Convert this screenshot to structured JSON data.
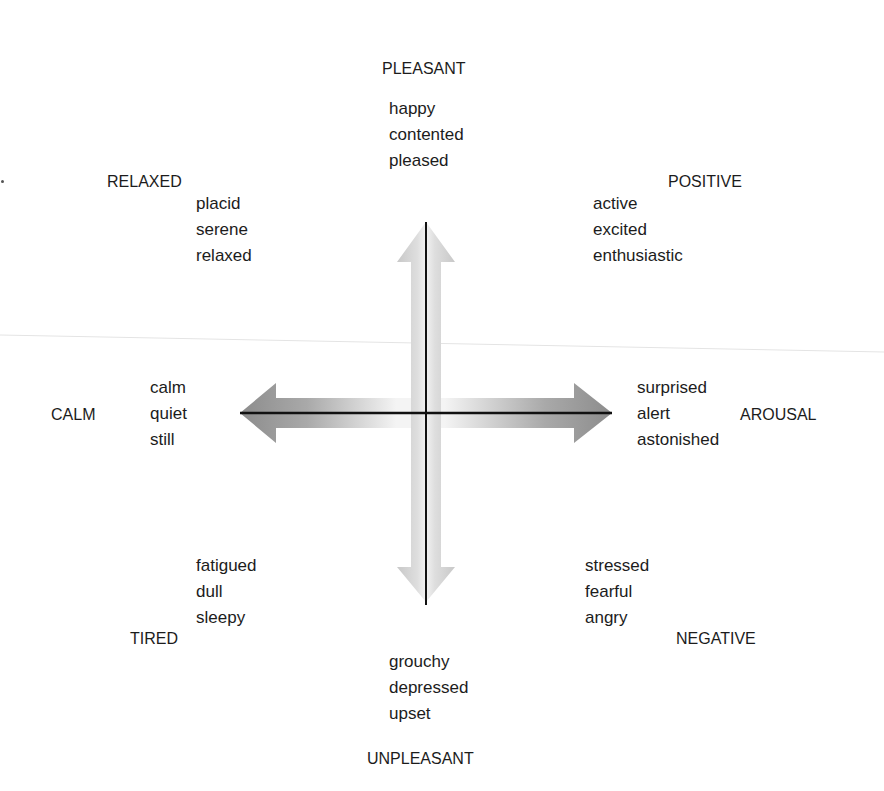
{
  "diagram": {
    "axes": {
      "vertical": {
        "top_label": "PLEASANT",
        "bottom_label": "UNPLEASANT"
      },
      "horizontal": {
        "left_label": "CALM",
        "right_label": "AROUSAL"
      },
      "diagonal": {
        "top_left_label": "RELAXED",
        "top_right_label": "POSITIVE",
        "bottom_left_label": "TIRED",
        "bottom_right_label": "NEGATIVE"
      }
    },
    "word_groups": {
      "pleasant": [
        "happy",
        "contented",
        "pleased"
      ],
      "relaxed": [
        "placid",
        "serene",
        "relaxed"
      ],
      "positive": [
        "active",
        "excited",
        "enthusiastic"
      ],
      "calm": [
        "calm",
        "quiet",
        "still"
      ],
      "arousal": [
        "surprised",
        "alert",
        "astonished"
      ],
      "tired": [
        "fatigued",
        "dull",
        "sleepy"
      ],
      "negative": [
        "stressed",
        "fearful",
        "angry"
      ],
      "unpleasant": [
        "grouchy",
        "depressed",
        "upset"
      ]
    },
    "colors": {
      "axis_line": "#111111",
      "arrow_dark": "#8a8a8a",
      "arrow_light": "#f2f2f2",
      "text": "#1c1c1c"
    }
  }
}
